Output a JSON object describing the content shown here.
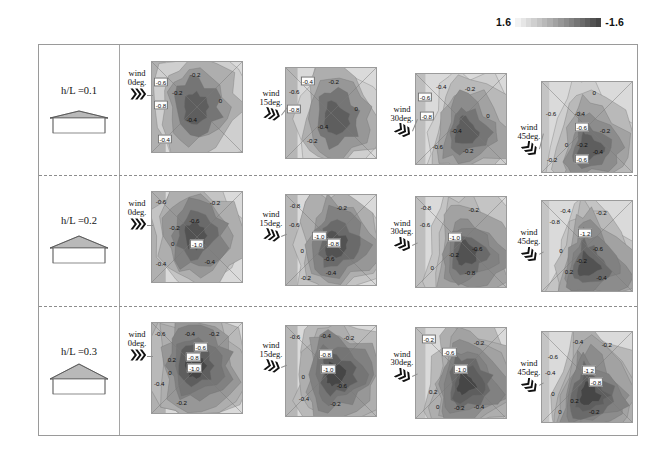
{
  "colorbar": {
    "name": "pressure-coefficient-colorbar",
    "max_label": "1.6",
    "min_label": "-1.6",
    "steps": [
      "#f2f2f2",
      "#e6e6e6",
      "#dadada",
      "#cfcfcf",
      "#c4c4c4",
      "#b9b9b9",
      "#aeaeae",
      "#a2a2a2",
      "#979797",
      "#8c8c8c",
      "#818181",
      "#757575",
      "#6a6a6a",
      "#5e5e5e",
      "#525252",
      "#464646"
    ]
  },
  "rows": [
    {
      "label": "h/L =0.1",
      "roof_pitch": "low",
      "panels": [
        {
          "wind_label_l1": "wind",
          "wind_label_l2": "0deg.",
          "angle": 0,
          "labels": [
            {
              "v": "-0.6",
              "x": 10,
              "y": 22,
              "boxed": true
            },
            {
              "v": "-0.2",
              "x": 48,
              "y": 13,
              "boxed": false
            },
            {
              "v": "-0.2",
              "x": 28,
              "y": 33,
              "boxed": false
            },
            {
              "v": "-0.8",
              "x": 10,
              "y": 48,
              "boxed": true
            },
            {
              "v": "0",
              "x": 76,
              "y": 42,
              "boxed": false
            },
            {
              "v": "-0.4",
              "x": 44,
              "y": 63,
              "boxed": false
            },
            {
              "v": "-0.4",
              "x": 14,
              "y": 85,
              "boxed": true
            }
          ]
        },
        {
          "wind_label_l1": "wind",
          "wind_label_l2": "15deg.",
          "angle": 15,
          "labels": [
            {
              "v": "-0.4",
              "x": 24,
              "y": 14,
              "boxed": true
            },
            {
              "v": "-0.2",
              "x": 53,
              "y": 14,
              "boxed": false
            },
            {
              "v": "-0.6",
              "x": 9,
              "y": 25,
              "boxed": false
            },
            {
              "v": "-0.8",
              "x": 9,
              "y": 46,
              "boxed": true
            },
            {
              "v": "0",
              "x": 78,
              "y": 44,
              "boxed": false
            },
            {
              "v": "-0.4",
              "x": 41,
              "y": 64,
              "boxed": false
            },
            {
              "v": "-0.2",
              "x": 29,
              "y": 80,
              "boxed": false
            }
          ]
        },
        {
          "wind_label_l1": "wind",
          "wind_label_l2": "30deg.",
          "angle": 30,
          "labels": [
            {
              "v": "-0.4",
              "x": 28,
              "y": 13,
              "boxed": false
            },
            {
              "v": "-0.2",
              "x": 60,
              "y": 16,
              "boxed": false
            },
            {
              "v": "-0.6",
              "x": 10,
              "y": 26,
              "boxed": true
            },
            {
              "v": "-0.8",
              "x": 12,
              "y": 47,
              "boxed": true
            },
            {
              "v": "0",
              "x": 80,
              "y": 46,
              "boxed": false
            },
            {
              "v": "-0.4",
              "x": 45,
              "y": 62,
              "boxed": false
            },
            {
              "v": "-0.6",
              "x": 24,
              "y": 80,
              "boxed": false
            },
            {
              "v": "-0.2",
              "x": 58,
              "y": 84,
              "boxed": false
            }
          ]
        },
        {
          "wind_label_l1": "wind",
          "wind_label_l2": "45deg.",
          "angle": 45,
          "labels": [
            {
              "v": "0",
              "x": 58,
              "y": 11,
              "boxed": false
            },
            {
              "v": "-0.6",
              "x": 10,
              "y": 34,
              "boxed": false
            },
            {
              "v": "-0.4",
              "x": 42,
              "y": 34,
              "boxed": false
            },
            {
              "v": "-0.6",
              "x": 44,
              "y": 50,
              "boxed": true
            },
            {
              "v": "-0.2",
              "x": 70,
              "y": 53,
              "boxed": false
            },
            {
              "v": "0",
              "x": 27,
              "y": 69,
              "boxed": false
            },
            {
              "v": "-0.2",
              "x": 45,
              "y": 69,
              "boxed": false
            },
            {
              "v": "-0.4",
              "x": 62,
              "y": 77,
              "boxed": false
            },
            {
              "v": "-0.2",
              "x": 11,
              "y": 85,
              "boxed": false
            },
            {
              "v": "-0.6",
              "x": 44,
              "y": 85,
              "boxed": true
            }
          ]
        }
      ]
    },
    {
      "label": "h/L =0.2",
      "roof_pitch": "medium",
      "panels": [
        {
          "wind_label_l1": "wind",
          "wind_label_l2": "0deg.",
          "angle": 0,
          "labels": [
            {
              "v": "-0.6",
              "x": 10,
              "y": 10,
              "boxed": false
            },
            {
              "v": "-0.2",
              "x": 70,
              "y": 11,
              "boxed": false
            },
            {
              "v": "-0.6",
              "x": 47,
              "y": 31,
              "boxed": false
            },
            {
              "v": "-0.2",
              "x": 25,
              "y": 39,
              "boxed": false
            },
            {
              "v": "0",
              "x": 23,
              "y": 57,
              "boxed": false
            },
            {
              "v": "-1.0",
              "x": 50,
              "y": 58,
              "boxed": true
            },
            {
              "v": "-0.4",
              "x": 64,
              "y": 77,
              "boxed": false
            },
            {
              "v": "-0.4",
              "x": 10,
              "y": 79,
              "boxed": false
            }
          ]
        },
        {
          "wind_label_l1": "wind",
          "wind_label_l2": "15deg.",
          "angle": 15,
          "labels": [
            {
              "v": "-0.8",
              "x": 10,
              "y": 11,
              "boxed": false
            },
            {
              "v": "-0.2",
              "x": 62,
              "y": 14,
              "boxed": false
            },
            {
              "v": "-0.6",
              "x": 9,
              "y": 33,
              "boxed": false
            },
            {
              "v": "-1.0",
              "x": 37,
              "y": 46,
              "boxed": true
            },
            {
              "v": "-0.8",
              "x": 53,
              "y": 54,
              "boxed": true
            },
            {
              "v": "0",
              "x": 18,
              "y": 62,
              "boxed": false
            },
            {
              "v": "-0.6",
              "x": 48,
              "y": 70,
              "boxed": false
            },
            {
              "v": "-0.4",
              "x": 50,
              "y": 86,
              "boxed": false
            },
            {
              "v": "-0.2",
              "x": 22,
              "y": 92,
              "boxed": false
            }
          ]
        },
        {
          "wind_label_l1": "wind",
          "wind_label_l2": "30deg.",
          "angle": 30,
          "labels": [
            {
              "v": "-0.8",
              "x": 11,
              "y": 11,
              "boxed": false
            },
            {
              "v": "-0.2",
              "x": 64,
              "y": 13,
              "boxed": false
            },
            {
              "v": "-0.6",
              "x": 10,
              "y": 30,
              "boxed": false
            },
            {
              "v": "-1.0",
              "x": 43,
              "y": 44,
              "boxed": true
            },
            {
              "v": "-0.6",
              "x": 68,
              "y": 56,
              "boxed": false
            },
            {
              "v": "-0.2",
              "x": 42,
              "y": 63,
              "boxed": false
            },
            {
              "v": "0",
              "x": 18,
              "y": 77,
              "boxed": false
            },
            {
              "v": "-0.8",
              "x": 60,
              "y": 83,
              "boxed": false
            }
          ]
        },
        {
          "wind_label_l1": "wind",
          "wind_label_l2": "45deg.",
          "angle": 45,
          "labels": [
            {
              "v": "-0.4",
              "x": 26,
              "y": 10,
              "boxed": false
            },
            {
              "v": "-0.2",
              "x": 66,
              "y": 12,
              "boxed": false
            },
            {
              "v": "-0.8",
              "x": 14,
              "y": 22,
              "boxed": false
            },
            {
              "v": "-1.2",
              "x": 48,
              "y": 36,
              "boxed": true
            },
            {
              "v": "-0.6",
              "x": 62,
              "y": 52,
              "boxed": false
            },
            {
              "v": "0",
              "x": 21,
              "y": 54,
              "boxed": false
            },
            {
              "v": "-0.2",
              "x": 44,
              "y": 66,
              "boxed": false
            },
            {
              "v": "0.2",
              "x": 30,
              "y": 78,
              "boxed": false
            },
            {
              "v": "-0.4",
              "x": 66,
              "y": 84,
              "boxed": false
            }
          ]
        }
      ]
    },
    {
      "label": "h/L =0.3",
      "roof_pitch": "steep",
      "panels": [
        {
          "wind_label_l1": "wind",
          "wind_label_l2": "0deg.",
          "angle": 0,
          "labels": [
            {
              "v": "-0.6",
              "x": 9,
              "y": 11,
              "boxed": false
            },
            {
              "v": "-0.4",
              "x": 42,
              "y": 11,
              "boxed": false
            },
            {
              "v": "-0.2",
              "x": 69,
              "y": 11,
              "boxed": false
            },
            {
              "v": "-0.6",
              "x": 54,
              "y": 27,
              "boxed": true
            },
            {
              "v": "-0.8",
              "x": 46,
              "y": 38,
              "boxed": true
            },
            {
              "v": "0.2",
              "x": 22,
              "y": 40,
              "boxed": false
            },
            {
              "v": "-1.0",
              "x": 47,
              "y": 50,
              "boxed": true
            },
            {
              "v": "0",
              "x": 20,
              "y": 54,
              "boxed": false
            },
            {
              "v": "-0.4",
              "x": 8,
              "y": 67,
              "boxed": false
            },
            {
              "v": "-0.2",
              "x": 33,
              "y": 88,
              "boxed": false
            }
          ]
        },
        {
          "wind_label_l1": "wind",
          "wind_label_l2": "15deg.",
          "angle": 15,
          "labels": [
            {
              "v": "-0.6",
              "x": 10,
              "y": 11,
              "boxed": false
            },
            {
              "v": "-0.4",
              "x": 44,
              "y": 10,
              "boxed": false
            },
            {
              "v": "-0.2",
              "x": 70,
              "y": 13,
              "boxed": false
            },
            {
              "v": "-0.8",
              "x": 44,
              "y": 32,
              "boxed": true
            },
            {
              "v": "-1.0",
              "x": 47,
              "y": 48,
              "boxed": true
            },
            {
              "v": "0",
              "x": 19,
              "y": 56,
              "boxed": false
            },
            {
              "v": "-0.6",
              "x": 62,
              "y": 66,
              "boxed": false
            },
            {
              "v": "-0.4",
              "x": 20,
              "y": 80,
              "boxed": false
            },
            {
              "v": "-0.2",
              "x": 55,
              "y": 86,
              "boxed": false
            }
          ]
        },
        {
          "wind_label_l1": "wind",
          "wind_label_l2": "30deg.",
          "angle": 30,
          "labels": [
            {
              "v": "-0.2",
              "x": 14,
              "y": 12,
              "boxed": true
            },
            {
              "v": "-0.2",
              "x": 70,
              "y": 15,
              "boxed": false
            },
            {
              "v": "-0.6",
              "x": 37,
              "y": 26,
              "boxed": true
            },
            {
              "v": "-1.0",
              "x": 50,
              "y": 45,
              "boxed": true
            },
            {
              "v": "0.2",
              "x": 19,
              "y": 70,
              "boxed": false
            },
            {
              "v": "0",
              "x": 24,
              "y": 86,
              "boxed": false
            },
            {
              "v": "-0.2",
              "x": 48,
              "y": 87,
              "boxed": false
            },
            {
              "v": "-0.4",
              "x": 70,
              "y": 86,
              "boxed": false
            }
          ]
        },
        {
          "wind_label_l1": "wind",
          "wind_label_l2": "45deg.",
          "angle": 45,
          "labels": [
            {
              "v": "-0.4",
              "x": 40,
              "y": 10,
              "boxed": false
            },
            {
              "v": "-0.2",
              "x": 72,
              "y": 13,
              "boxed": false
            },
            {
              "v": "-0.6",
              "x": 12,
              "y": 27,
              "boxed": false
            },
            {
              "v": "-1.2",
              "x": 52,
              "y": 42,
              "boxed": true
            },
            {
              "v": "-0.4",
              "x": 9,
              "y": 44,
              "boxed": false
            },
            {
              "v": "-0.8",
              "x": 60,
              "y": 56,
              "boxed": true
            },
            {
              "v": "0",
              "x": 12,
              "y": 68,
              "boxed": false
            },
            {
              "v": "0.2",
              "x": 36,
              "y": 76,
              "boxed": false
            },
            {
              "v": "0",
              "x": 20,
              "y": 88,
              "boxed": false
            },
            {
              "v": "-0.2",
              "x": 58,
              "y": 88,
              "boxed": false
            }
          ]
        }
      ]
    }
  ],
  "chart_data": {
    "type": "heatmap",
    "subtitle": "Rows: roof height-to-length ratio h/L. Columns: wind incidence angle.",
    "variable": "pressure coefficient Cp",
    "colorbar": {
      "min": -1.6,
      "max": 1.6,
      "orientation": "horizontal",
      "position": "top-right",
      "scale": "grayscale-discrete"
    },
    "row_categories": [
      "h/L =0.1",
      "h/L =0.2",
      "h/L =0.3"
    ],
    "column_categories": [
      "wind 0deg.",
      "wind 15deg.",
      "wind 30deg.",
      "wind 45deg."
    ],
    "grid": true,
    "legend": "colorbar",
    "panel_contour_levels": {
      "h/L=0.1": {
        "0deg": [
          -0.8,
          -0.6,
          -0.4,
          -0.2,
          0.0
        ],
        "15deg": [
          -0.8,
          -0.6,
          -0.4,
          -0.2,
          0.0
        ],
        "30deg": [
          -0.8,
          -0.6,
          -0.4,
          -0.2,
          0.0
        ],
        "45deg": [
          -0.6,
          -0.4,
          -0.2,
          0.0
        ]
      },
      "h/L=0.2": {
        "0deg": [
          -1.0,
          -0.8,
          -0.6,
          -0.4,
          -0.2,
          0.0
        ],
        "15deg": [
          -1.0,
          -0.8,
          -0.6,
          -0.4,
          -0.2,
          0.0
        ],
        "30deg": [
          -1.0,
          -0.8,
          -0.6,
          -0.4,
          -0.2,
          0.0
        ],
        "45deg": [
          -1.2,
          -0.8,
          -0.6,
          -0.4,
          -0.2,
          0.0,
          0.2
        ]
      },
      "h/L=0.3": {
        "0deg": [
          -1.0,
          -0.8,
          -0.6,
          -0.4,
          -0.2,
          0.0,
          0.2
        ],
        "15deg": [
          -1.0,
          -0.8,
          -0.6,
          -0.4,
          -0.2,
          0.0
        ],
        "30deg": [
          -1.0,
          -0.6,
          -0.4,
          -0.2,
          0.0,
          0.2
        ],
        "45deg": [
          -1.2,
          -0.8,
          -0.6,
          -0.4,
          -0.2,
          0.0,
          0.2
        ]
      }
    },
    "peak_suction_by_row": {
      "h/L=0.1": -0.8,
      "h/L=0.2": -1.2,
      "h/L=0.3": -1.2
    }
  }
}
